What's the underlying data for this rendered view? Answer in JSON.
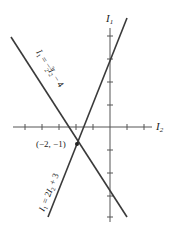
{
  "diagram": {
    "axes": {
      "vertical_label": "I",
      "vertical_sub": "1",
      "horizontal_label": "I",
      "horizontal_sub": "2"
    },
    "lines": [
      {
        "name": "line-1",
        "label_prefix": "I",
        "label_sub": "1",
        "label_eq": " = −",
        "label_frac_num": "3",
        "label_frac_den": "2",
        "label_var": "I",
        "label_var_sub": "2",
        "label_rest": " − 4",
        "equation": "I1 = -3/2 I2 - 4"
      },
      {
        "name": "line-2",
        "label_prefix": "I",
        "label_sub": "1",
        "label_eq": " = 2",
        "label_var": "I",
        "label_var_sub": "2",
        "label_rest": " + 3",
        "equation": "I1 = 2I2 + 3"
      }
    ],
    "intersection": {
      "label": "(−2, −1)",
      "I2": -2,
      "I1": -1
    },
    "colors": {
      "line": "#3a3a3a",
      "axis": "#555555",
      "background": "#ffffff"
    }
  }
}
